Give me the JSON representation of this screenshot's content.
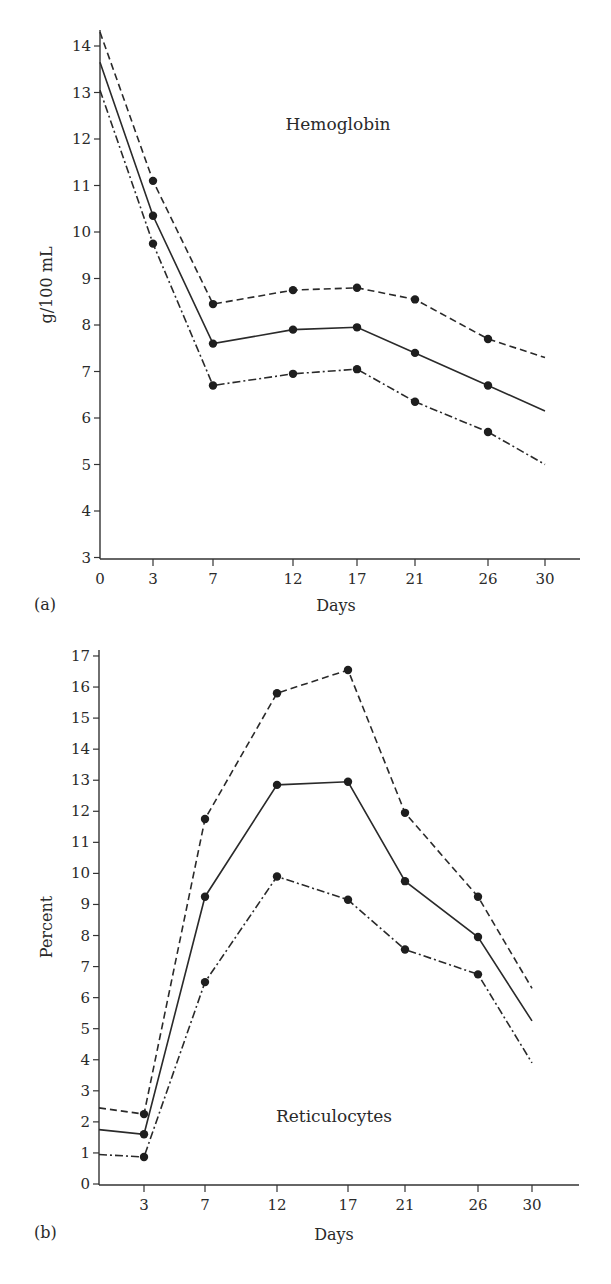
{
  "chart_data": [
    {
      "panel": "(a)",
      "type": "line",
      "title": "",
      "annotation": "Hemoglobin",
      "xlabel": "Days",
      "ylabel": "g/100 mL",
      "x_ticks": [
        "0",
        "3",
        "7",
        "12",
        "17",
        "21",
        "26",
        "30"
      ],
      "y_ticks": [
        "3",
        "4",
        "5",
        "6",
        "7",
        "8",
        "9",
        "10",
        "11",
        "12",
        "13",
        "14"
      ],
      "ylim": [
        3,
        14.4
      ],
      "grid": false,
      "legend": null,
      "x": [
        0,
        3,
        7,
        12,
        17,
        21,
        26,
        30
      ],
      "markers_at": [
        3,
        7,
        12,
        17,
        21,
        26
      ],
      "series": [
        {
          "name": "upper (dashed)",
          "style": "dashed",
          "values": [
            14.3,
            11.1,
            8.45,
            8.75,
            8.8,
            8.55,
            7.7,
            7.3
          ]
        },
        {
          "name": "mean (solid)",
          "style": "solid",
          "values": [
            13.65,
            10.35,
            7.6,
            7.9,
            7.95,
            7.4,
            6.7,
            6.15
          ]
        },
        {
          "name": "lower (dash-dot)",
          "style": "dashdot",
          "values": [
            13.05,
            9.75,
            6.7,
            6.95,
            7.05,
            6.35,
            5.7,
            5.0
          ]
        }
      ]
    },
    {
      "panel": "(b)",
      "type": "line",
      "title": "",
      "annotation": "Reticulocytes",
      "xlabel": "Days",
      "ylabel": "Percent",
      "x_ticks": [
        "3",
        "7",
        "12",
        "17",
        "21",
        "26",
        "30"
      ],
      "y_ticks": [
        "0",
        "1",
        "2",
        "3",
        "4",
        "5",
        "6",
        "7",
        "8",
        "9",
        "10",
        "11",
        "12",
        "13",
        "14",
        "15",
        "16",
        "17"
      ],
      "ylim": [
        0,
        17
      ],
      "grid": false,
      "legend": null,
      "x": [
        0,
        3,
        7,
        12,
        17,
        21,
        26,
        30
      ],
      "markers_at": [
        3,
        7,
        12,
        17,
        21,
        26
      ],
      "series": [
        {
          "name": "upper (dashed)",
          "style": "dashed",
          "values": [
            2.45,
            2.25,
            11.75,
            15.8,
            16.55,
            11.95,
            9.25,
            6.3
          ]
        },
        {
          "name": "mean (solid)",
          "style": "solid",
          "values": [
            1.75,
            1.6,
            9.25,
            12.85,
            12.95,
            9.75,
            7.95,
            5.25
          ]
        },
        {
          "name": "lower (dash-dot)",
          "style": "dashdot",
          "values": [
            0.95,
            0.87,
            6.5,
            9.9,
            9.15,
            7.55,
            6.75,
            3.9
          ]
        }
      ]
    }
  ],
  "layout": {
    "a": {
      "x_px": {
        "0": 100,
        "3": 153,
        "7": 213,
        "12": 293,
        "17": 357,
        "21": 415,
        "26": 488,
        "30": 545
      },
      "y0_px": 46,
      "y0_val": 14,
      "px_per_unit": 46.5,
      "axis_left": 100,
      "axis_bottom": 559,
      "axis_top": 30,
      "axis_right": 580
    },
    "b": {
      "x_px": {
        "0": 99,
        "3": 144,
        "7": 205,
        "12": 277,
        "17": 348,
        "21": 405,
        "26": 478,
        "30": 532
      },
      "y0_px": 1184,
      "y0_val": 0,
      "px_per_unit": 31.06,
      "axis_left": 99,
      "axis_bottom": 1185,
      "axis_top": 650,
      "axis_right": 579
    }
  }
}
